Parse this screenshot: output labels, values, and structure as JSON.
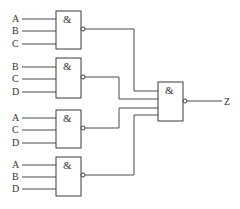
{
  "diagram": {
    "type": "logic-circuit",
    "gate_symbol": "&",
    "output_label": "Z",
    "input_gates": [
      {
        "id": "gate-1",
        "inputs": [
          "A",
          "B",
          "C"
        ],
        "type": "NAND"
      },
      {
        "id": "gate-2",
        "inputs": [
          "B",
          "C",
          "D"
        ],
        "type": "NAND"
      },
      {
        "id": "gate-3",
        "inputs": [
          "A",
          "C",
          "D"
        ],
        "type": "NAND"
      },
      {
        "id": "gate-4",
        "inputs": [
          "A",
          "B",
          "D"
        ],
        "type": "NAND"
      }
    ],
    "output_gate": {
      "id": "gate-out",
      "type": "NAND",
      "inputs_from": [
        "gate-1",
        "gate-2",
        "gate-3",
        "gate-4"
      ],
      "symbol": "&"
    },
    "colors": {
      "line": "#4a4a4a",
      "background": "#ffffff"
    }
  }
}
